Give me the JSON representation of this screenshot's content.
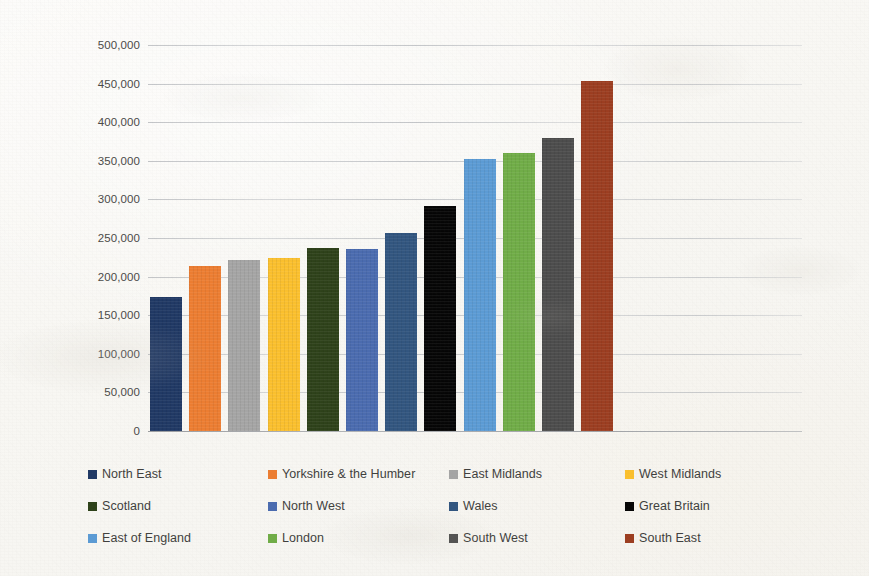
{
  "chart_data": {
    "type": "bar",
    "title": "",
    "subtitle": "",
    "xlabel": "",
    "ylabel": "",
    "ylim": [
      0,
      500000
    ],
    "ytick_step": 50000,
    "grid": true,
    "grid_axis": "y",
    "legend_position": "bottom",
    "legend_columns": 4,
    "legend_rows": 3,
    "ytick_labels": [
      "500,000",
      "450,000",
      "400,000",
      "350,000",
      "300,000",
      "250,000",
      "200,000",
      "150,000",
      "100,000",
      "50,000",
      "0"
    ],
    "ytick_values": [
      500000,
      450000,
      400000,
      350000,
      300000,
      250000,
      200000,
      150000,
      100000,
      50000,
      0
    ],
    "xtick_labels": [],
    "categories": [
      "North East",
      "Yorkshire & the Humber",
      "East Midlands",
      "West Midlands",
      "Scotland",
      "North West",
      "Wales",
      "Great Britain",
      "East of England",
      "London",
      "South West",
      "South East"
    ],
    "values": [
      173000,
      214000,
      222000,
      224000,
      237000,
      236000,
      256000,
      291000,
      352000,
      360000,
      379000,
      453000
    ],
    "colors": [
      "#1f3864",
      "#ed7d31",
      "#a5a5a5",
      "#fbc02d",
      "#2d4119",
      "#4a6bb0",
      "#31557f",
      "#050505",
      "#5b9bd5",
      "#70ad47",
      "#4c4c4c",
      "#9c3d20"
    ],
    "series": [
      {
        "name": "Average house price",
        "values": [
          173000,
          214000,
          222000,
          224000,
          237000,
          236000,
          256000,
          291000,
          352000,
          360000,
          379000,
          453000
        ]
      }
    ]
  },
  "legend": {
    "items": [
      {
        "label": "North East",
        "color": "#1f3864"
      },
      {
        "label": "Yorkshire & the Humber",
        "color": "#ed7d31"
      },
      {
        "label": "East Midlands",
        "color": "#a5a5a5"
      },
      {
        "label": "West Midlands",
        "color": "#fbc02d"
      },
      {
        "label": "Scotland",
        "color": "#2d4119"
      },
      {
        "label": "North West",
        "color": "#4a6bb0"
      },
      {
        "label": "Wales",
        "color": "#31557f"
      },
      {
        "label": "Great Britain",
        "color": "#050505"
      },
      {
        "label": "East of England",
        "color": "#5b9bd5"
      },
      {
        "label": "London",
        "color": "#70ad47"
      },
      {
        "label": "South West",
        "color": "#4c4c4c"
      },
      {
        "label": "South East",
        "color": "#9c3d20"
      }
    ]
  }
}
